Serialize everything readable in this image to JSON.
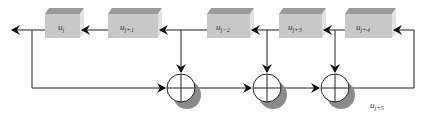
{
  "diagram": {
    "registers": [
      {
        "id": "u_j",
        "base": "u",
        "sub": "j",
        "x": 45,
        "w": 35
      },
      {
        "id": "u_j+1",
        "base": "u",
        "sub": "j+1",
        "x": 108,
        "w": 50
      },
      {
        "id": "u_j+2",
        "base": "u",
        "sub": "j−2",
        "x": 207,
        "w": 43
      },
      {
        "id": "u_j+3",
        "base": "u",
        "sub": "j+3",
        "x": 279,
        "w": 43
      },
      {
        "id": "u_j+4",
        "base": "u",
        "sub": "j+4",
        "x": 345,
        "w": 47
      }
    ],
    "xor_nodes": [
      {
        "id": "xor-1",
        "cx": 181,
        "cy": 88
      },
      {
        "id": "xor-2",
        "cx": 267,
        "cy": 88
      },
      {
        "id": "xor-3",
        "cx": 335,
        "cy": 88
      }
    ],
    "output_label": {
      "base": "u",
      "sub": "j+5"
    },
    "colors": {
      "box_front": "#c8c8c8",
      "box_top": "#9a9a9a",
      "box_side": "#e2e2e2",
      "line": "#222222",
      "shadow": "#8a8a8a"
    }
  }
}
